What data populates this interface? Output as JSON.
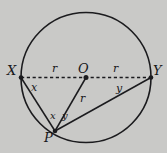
{
  "figure": {
    "name": "circle-geometry-diagram",
    "background_color": "#c9c9c7",
    "stroke_color": "#1b1b1e",
    "width": 167,
    "height": 153,
    "points": {
      "center": {
        "label": "O",
        "x": 86,
        "y": 77.5
      },
      "left": {
        "label": "X",
        "x": 21,
        "y": 77.5
      },
      "right": {
        "label": "Y",
        "x": 151,
        "y": 77.5
      },
      "bottom": {
        "label": "P",
        "x": 55,
        "y": 131
      }
    },
    "circle": {
      "cx": 86,
      "cy": 77.5,
      "r": 65
    },
    "segment_labels": {
      "radius_left": "r",
      "radius_right": "r",
      "radius_op": "r",
      "chord_xp": "x",
      "chord_py": "y"
    },
    "angle_labels": {
      "angle_x": "x",
      "angle_y": "y"
    }
  }
}
